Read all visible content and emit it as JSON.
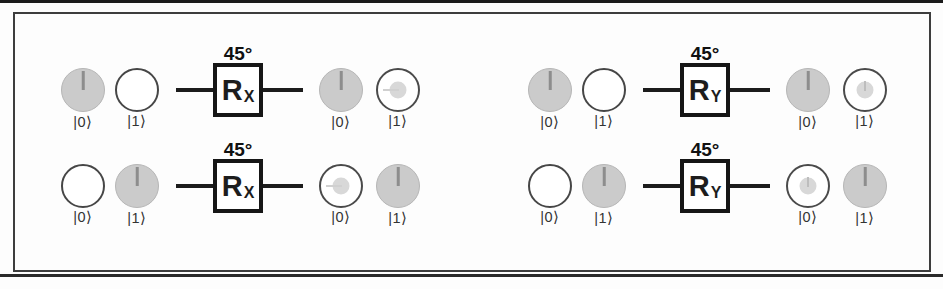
{
  "circuits": [
    {
      "angle": "45°",
      "gate": {
        "main": "R",
        "sub": "X"
      },
      "inputs": [
        {
          "label": "|0⟩",
          "fill": "full",
          "pointer": "up"
        },
        {
          "label": "|1⟩",
          "fill": "empty",
          "pointer": "none"
        }
      ],
      "outputs": [
        {
          "label": "|0⟩",
          "fill": "full",
          "pointer": "up"
        },
        {
          "label": "|1⟩",
          "fill": "dot",
          "pointer": "left"
        }
      ]
    },
    {
      "angle": "45°",
      "gate": {
        "main": "R",
        "sub": "X"
      },
      "inputs": [
        {
          "label": "|0⟩",
          "fill": "empty",
          "pointer": "none"
        },
        {
          "label": "|1⟩",
          "fill": "full",
          "pointer": "up"
        }
      ],
      "outputs": [
        {
          "label": "|0⟩",
          "fill": "dot",
          "pointer": "left"
        },
        {
          "label": "|1⟩",
          "fill": "full",
          "pointer": "up"
        }
      ]
    },
    {
      "angle": "45°",
      "gate": {
        "main": "R",
        "sub": "Y"
      },
      "inputs": [
        {
          "label": "|0⟩",
          "fill": "full",
          "pointer": "up"
        },
        {
          "label": "|1⟩",
          "fill": "empty",
          "pointer": "none"
        }
      ],
      "outputs": [
        {
          "label": "|0⟩",
          "fill": "full",
          "pointer": "up"
        },
        {
          "label": "|1⟩",
          "fill": "dot",
          "pointer": "up"
        }
      ]
    },
    {
      "angle": "45°",
      "gate": {
        "main": "R",
        "sub": "Y"
      },
      "inputs": [
        {
          "label": "|0⟩",
          "fill": "empty",
          "pointer": "none"
        },
        {
          "label": "|1⟩",
          "fill": "full",
          "pointer": "up"
        }
      ],
      "outputs": [
        {
          "label": "|0⟩",
          "fill": "dot",
          "pointer": "up"
        },
        {
          "label": "|1⟩",
          "fill": "full",
          "pointer": "up"
        }
      ]
    }
  ],
  "colors": {
    "filled_state": "#cbcbcb",
    "dot_state": "#d8d8d8",
    "line": "#1c1c1c"
  }
}
